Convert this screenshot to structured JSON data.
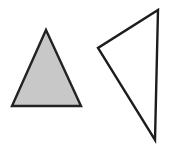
{
  "canvas": {
    "width": 180,
    "height": 149,
    "background_color": "#ffffff",
    "description": "two-triangles-figure"
  },
  "shapes": [
    {
      "id": "left-triangle",
      "name": "filled-upright-triangle",
      "type": "triangle",
      "orientation": "upright-isosceles",
      "fill_color": "#c8c8c8",
      "stroke_color": "#232323",
      "stroke_width": 2.4,
      "points": "46,30 81,106 12,106",
      "vertices": [
        {
          "label": "apex",
          "x": 46,
          "y": 30
        },
        {
          "label": "base-right",
          "x": 81,
          "y": 106
        },
        {
          "label": "base-left",
          "x": 12,
          "y": 106
        }
      ]
    },
    {
      "id": "right-triangle",
      "name": "outlined-scalene-triangle",
      "type": "triangle",
      "orientation": "tilted-scalene",
      "fill_color": "#ffffff",
      "stroke_color": "#1d1d1d",
      "stroke_width": 2.4,
      "points": "158,10 155,140 98,48",
      "vertices": [
        {
          "label": "top",
          "x": 158,
          "y": 10
        },
        {
          "label": "bottom",
          "x": 155,
          "y": 140
        },
        {
          "label": "left",
          "x": 98,
          "y": 48
        }
      ]
    }
  ]
}
